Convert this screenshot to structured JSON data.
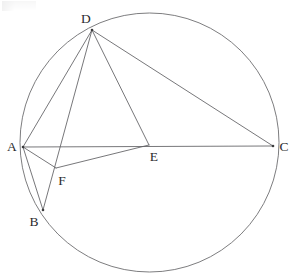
{
  "figure": {
    "type": "euclidean-geometry-diagram",
    "canvas": {
      "width": 296,
      "height": 280,
      "background": "#ffffff"
    },
    "stroke_color": "#5f5f62",
    "circle_stroke_color": "#6e6e70",
    "label_color": "#2c2c2e"
  },
  "circle": {
    "name": "circumcircle",
    "center_x": 149.5,
    "center_y": 142.5,
    "radius": 129.5
  },
  "points": [
    {
      "id": "A",
      "label": "A",
      "x": 23,
      "y": 147,
      "label_x": 12,
      "label_y": 147,
      "on_circle": true,
      "dot": true
    },
    {
      "id": "B",
      "label": "B",
      "x": 43,
      "y": 210,
      "label_x": 34,
      "label_y": 222,
      "on_circle": true,
      "dot": true
    },
    {
      "id": "C",
      "label": "C",
      "x": 273,
      "y": 146,
      "label_x": 284,
      "label_y": 147,
      "on_circle": true,
      "dot": true
    },
    {
      "id": "D",
      "label": "D",
      "x": 92,
      "y": 30,
      "label_x": 86,
      "label_y": 19,
      "on_circle": true,
      "dot": true
    },
    {
      "id": "E",
      "label": "E",
      "x": 149,
      "y": 145,
      "label_x": 154,
      "label_y": 157,
      "on_circle": false,
      "dot": false
    },
    {
      "id": "F",
      "label": "F",
      "x": 56,
      "y": 168,
      "label_x": 62,
      "label_y": 181,
      "on_circle": false,
      "dot": false
    }
  ],
  "segments": [
    {
      "id": "AC",
      "from": "A",
      "to": "C",
      "kind": "chord",
      "note": "diameter-like chord through E"
    },
    {
      "id": "AD",
      "from": "A",
      "to": "D",
      "kind": "chord",
      "note": ""
    },
    {
      "id": "AB",
      "from": "A",
      "to": "B",
      "kind": "chord",
      "note": ""
    },
    {
      "id": "DC",
      "from": "D",
      "to": "C",
      "kind": "chord",
      "note": ""
    },
    {
      "id": "DB",
      "from": "D",
      "to": "B",
      "kind": "chord",
      "note": "passes through F"
    },
    {
      "id": "DE",
      "from": "D",
      "to": "E",
      "kind": "cevian",
      "note": ""
    },
    {
      "id": "AF",
      "from": "A",
      "to": "F",
      "kind": "cevian",
      "note": ""
    },
    {
      "id": "FE",
      "from": "F",
      "to": "E",
      "kind": "cevian",
      "note": ""
    }
  ]
}
